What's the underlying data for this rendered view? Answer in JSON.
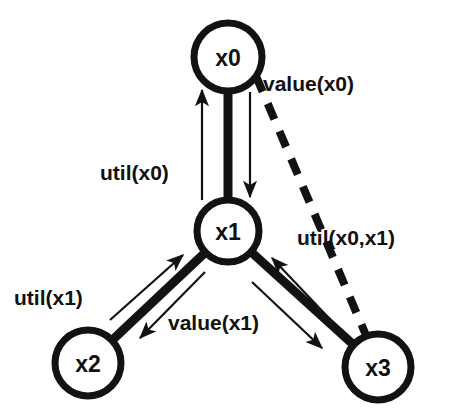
{
  "diagram": {
    "background_color": "#ffffff",
    "ink_color": "#121212",
    "nodes": [
      {
        "id": "x0",
        "label": "x0",
        "cx": 228,
        "cy": 57,
        "r": 34
      },
      {
        "id": "x1",
        "label": "x1",
        "cx": 228,
        "cy": 231,
        "r": 31
      },
      {
        "id": "x2",
        "label": "x2",
        "cx": 88,
        "cy": 363,
        "r": 33
      },
      {
        "id": "x3",
        "label": "x3",
        "cx": 378,
        "cy": 367,
        "r": 33
      }
    ],
    "edges": [
      {
        "id": "e-x0-x1",
        "from": "x0",
        "to": "x1",
        "style": "solid-thick"
      },
      {
        "id": "e-x1-x2",
        "from": "x1",
        "to": "x2",
        "style": "solid-thick"
      },
      {
        "id": "e-x1-x3",
        "from": "x1",
        "to": "x3",
        "style": "solid-thick"
      },
      {
        "id": "e-x0-x3",
        "from": "x0",
        "to": "x3",
        "style": "dashed-thick"
      }
    ],
    "messages": [
      {
        "id": "m-util-x0",
        "label": "util(x0)",
        "direction": "x1-to-x0",
        "label_x": 100,
        "label_y": 172
      },
      {
        "id": "m-value-x0",
        "label": "value(x0)",
        "direction": "x0-to-x1",
        "label_x": 263,
        "label_y": 83
      },
      {
        "id": "m-util-x0-x1",
        "label": "util(x0,x1)",
        "direction": "x3-to-x1",
        "label_x": 297,
        "label_y": 237
      },
      {
        "id": "m-util-x1",
        "label": "util(x1)",
        "direction": "x2-to-x1",
        "label_x": 14,
        "label_y": 297
      },
      {
        "id": "m-value-x1",
        "label": "value(x1)",
        "direction": "x1-to-x2",
        "label_x": 168,
        "label_y": 322
      }
    ]
  }
}
